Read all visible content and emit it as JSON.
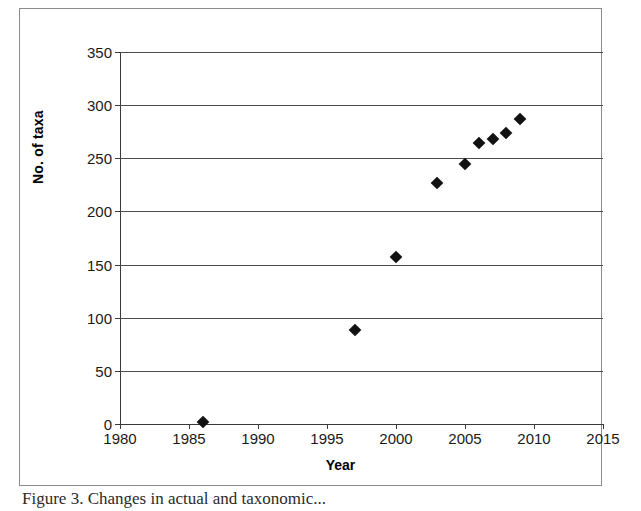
{
  "chart_data": {
    "type": "scatter",
    "title": "",
    "xlabel": "Year",
    "ylabel": "No. of taxa",
    "xlim": [
      1980,
      2015
    ],
    "ylim": [
      0,
      350
    ],
    "xticks": [
      1980,
      1985,
      1990,
      1995,
      2000,
      2005,
      2010,
      2015
    ],
    "yticks": [
      0,
      50,
      100,
      150,
      200,
      250,
      300,
      350
    ],
    "grid": "horizontal",
    "legend": "none",
    "marker": "filled-diamond",
    "marker_color": "#111111",
    "x": [
      1986,
      1997,
      2000,
      2003,
      2005,
      2006,
      2007,
      2008,
      2009
    ],
    "y": [
      2,
      88,
      157,
      227,
      245,
      264,
      268,
      274,
      287
    ],
    "series": [
      {
        "name": "No. of taxa",
        "points": [
          {
            "x": 1986,
            "y": 2
          },
          {
            "x": 1997,
            "y": 88
          },
          {
            "x": 2000,
            "y": 157
          },
          {
            "x": 2003,
            "y": 227
          },
          {
            "x": 2005,
            "y": 245
          },
          {
            "x": 2006,
            "y": 264
          },
          {
            "x": 2007,
            "y": 268
          },
          {
            "x": 2008,
            "y": 274
          },
          {
            "x": 2009,
            "y": 287
          }
        ]
      }
    ]
  },
  "axes": {
    "y_tick_labels": [
      "350",
      "300",
      "250",
      "200",
      "150",
      "100",
      "50",
      "0"
    ],
    "x_tick_labels": [
      "1980",
      "1985",
      "1990",
      "1995",
      "2000",
      "2005",
      "2010",
      "2015"
    ],
    "y_title": "No. of taxa",
    "x_title": "Year"
  },
  "caption": {
    "text": "Figure 3.  Changes in actual and taxonomic..."
  }
}
